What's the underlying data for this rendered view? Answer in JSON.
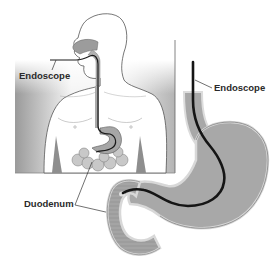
{
  "figure": {
    "type": "medical-illustration",
    "panels": [
      {
        "name": "body-overview",
        "description": "Human head and torso showing endoscope inserted through mouth, down esophagus into stomach and duodenum"
      },
      {
        "name": "stomach-detail",
        "description": "Enlarged stomach and duodenum with endoscope path"
      }
    ]
  },
  "labels": {
    "endoscope_left": "Endoscope",
    "endoscope_right": "Endoscope",
    "duodenum": "Duodenum"
  },
  "colors": {
    "background": "#ffffff",
    "panel_gradient_dark": "#9a9a9a",
    "panel_gradient_light": "#ffffff",
    "organ_fill": "#a9a9a9",
    "organ_rim": "#dcdcdc",
    "outline": "#555555",
    "endoscope": "#1a1a1a",
    "label_text": "#2a2a2a"
  }
}
